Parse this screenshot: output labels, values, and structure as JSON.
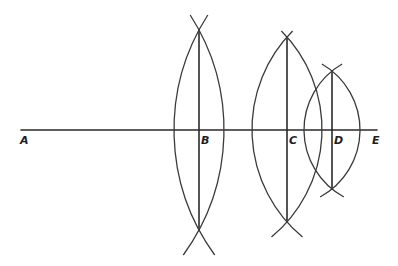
{
  "diagram": {
    "type": "geometric-construction",
    "colors": {
      "background": "#ffffff",
      "ink": "#2a2a2a"
    },
    "points": [
      {
        "id": "A",
        "label": "A",
        "x": 21,
        "y": 130
      },
      {
        "id": "B",
        "label": "B",
        "x": 199,
        "y": 130
      },
      {
        "id": "C",
        "label": "C",
        "x": 287,
        "y": 130
      },
      {
        "id": "D",
        "label": "D",
        "x": 332,
        "y": 130
      },
      {
        "id": "E",
        "label": "E",
        "x": 377,
        "y": 130
      }
    ],
    "segments": [
      {
        "name": "AE",
        "x1": 21,
        "y1": 130,
        "x2": 377,
        "y2": 130
      },
      {
        "name": "perpendicular-B",
        "x1": 199,
        "y1": 30,
        "x2": 199,
        "y2": 230
      },
      {
        "name": "perpendicular-C",
        "x1": 287,
        "y1": 37,
        "x2": 287,
        "y2": 222
      },
      {
        "name": "perpendicular-D",
        "x1": 332,
        "y1": 71,
        "x2": 332,
        "y2": 189
      }
    ],
    "lenses": [
      {
        "at": "B",
        "radius": 212.5
      },
      {
        "at": "C",
        "radius": 139.7
      },
      {
        "at": "D",
        "radius": 76.2
      }
    ]
  }
}
